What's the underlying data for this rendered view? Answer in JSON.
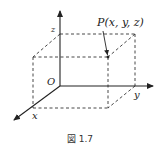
{
  "figure": {
    "caption": "図 1.7",
    "labels": {
      "point": "P(x, y, z)",
      "origin": "O",
      "x_axis": "x",
      "y_axis": "y",
      "z_axis": "z"
    },
    "colors": {
      "axis": "#222222",
      "dashed": "#333333",
      "background": "#ffffff"
    }
  }
}
